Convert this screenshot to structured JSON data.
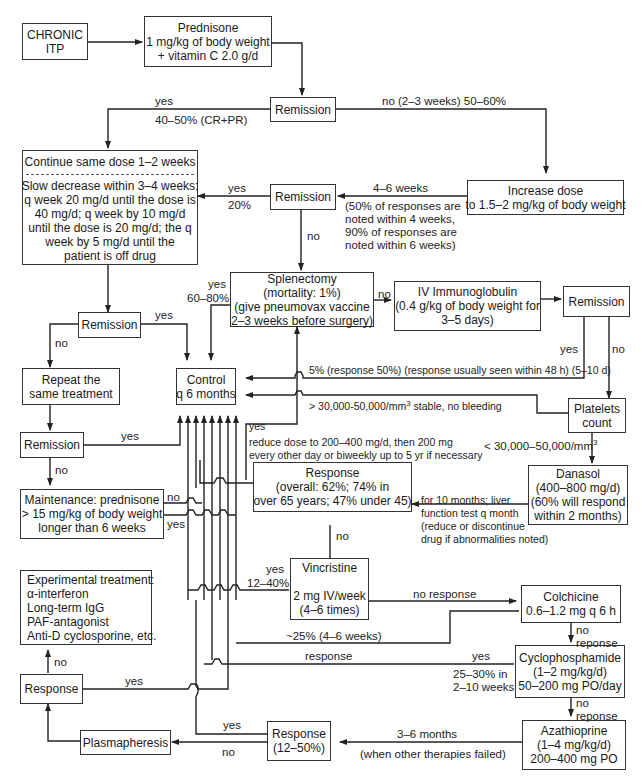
{
  "nodes": {
    "chronic_itp": [
      "CHRONIC",
      "ITP"
    ],
    "prednisone": [
      "Prednisone",
      "1 mg/kg of body weight",
      "+ vitamin C 2.0 g/d"
    ],
    "remission1": [
      "Remission"
    ],
    "continue_dose": {
      "header": "Continue same dose 1–2 weeks",
      "lines": [
        "Slow decrease within 3–4 weeks:",
        "q week 20 mg/d until the dose is",
        "40 mg/d; q week by 10 mg/d",
        "until the dose is 20 mg/d; the q",
        "week by 5 mg/d until the",
        "patient is off drug"
      ]
    },
    "increase_dose": [
      "Increase dose",
      "to 1.5–2 mg/kg of body weight"
    ],
    "remission2": [
      "Remission"
    ],
    "splenectomy": [
      "Splenectomy",
      "(mortality: 1%)",
      "(give pneumovax vaccine",
      "2–3 weeks before surgery)"
    ],
    "ivig": [
      "IV Immunoglobulin",
      "(0.4 g/kg of body weight for",
      "3–5 days)"
    ],
    "remission_ivig": [
      "Remission"
    ],
    "remission3": [
      "Remission"
    ],
    "repeat_treatment": [
      "Repeat the",
      "same treatment"
    ],
    "control": [
      "Control",
      "q 6 months"
    ],
    "platelets": [
      "Platelets",
      "count"
    ],
    "remission4": [
      "Remission"
    ],
    "danasol": [
      "Danasol",
      "(400–800 mg/d)",
      "(60% will respond",
      "within 2 months)"
    ],
    "response_danasol": [
      "Response",
      "(overall: 62%; 74% in",
      "over 65 years; 47% under 45)"
    ],
    "maintenance": [
      "Maintenance: prednisone",
      "> 15 mg/kg of body weight",
      "longer than 6 weeks"
    ],
    "experimental": [
      "Experimental treatment:",
      "α-interferon",
      "Long-term IgG",
      "PAF-antagonist",
      "Anti-D cyclosporine, etc."
    ],
    "vincristine": [
      "Vincristine",
      "",
      "2 mg IV/week",
      "(4–6 times)"
    ],
    "colchicine": [
      "Colchicine",
      "0.6–1.2 mg q 6 h"
    ],
    "cyclophosphamide": [
      "Cyclophosphamide",
      "(1–2 mg/kg/d)",
      "50–200 mg PO/day"
    ],
    "response_left": [
      "Response"
    ],
    "plasmapheresis": [
      "Plasmapheresis"
    ],
    "response_aza": [
      "Response",
      "(12–50%)"
    ],
    "azathioprine": [
      "Azathioprine",
      "(1–4 mg/kg/d)",
      "200–400 mg PO"
    ]
  },
  "labels": {
    "r1_yes": "yes",
    "r1_yes_pct": "40–50% (CR+PR)",
    "r1_no": "no (2–3 weeks) 50–60%",
    "r2_yes": "yes",
    "r2_yes_pct": "20%",
    "inc_weeks": "4–6 weeks",
    "inc_note": [
      "(50% of responses are",
      "noted within 4 weeks,",
      "90% of responses are",
      "noted within 6 weeks)"
    ],
    "r2_no": "no",
    "splen_yes": "yes",
    "splen_yes_pct": "60–80%",
    "splen_no": "no",
    "r3_yes": "yes",
    "r3_no": "no",
    "ivig_yes": "yes",
    "ivig_no": "no",
    "ivig_resp": "5% (response 50%) (response usually seen within 48 h) (5–10 d)",
    "platelets_high": "> 30,000-50,000/mm",
    "platelets_high_tail": " stable, no bleeding",
    "platelets_low": "< 30,000–50,000/mm",
    "sup3": "3",
    "r4_yes": "yes",
    "r4_no": "no",
    "danasol_yes": "yes",
    "danasol_reduce": [
      "reduce dose to 200–400 mg/d, then 200 mg",
      "every other day or biweekly up to 5 yr if necessary"
    ],
    "danasol_note": [
      "for 10 months; liver",
      "function test q month",
      "(reduce or discontinue",
      "drug if abnormalities noted)"
    ],
    "maint_no": "no",
    "maint_yes": "yes",
    "resp_no": "no",
    "vinc_yes": "yes",
    "vinc_yes_pct": "12–40%",
    "vinc_no_response": "no response",
    "colch_25": "~25% (4–6 weeks)",
    "colch_no": [
      "no",
      "reponse"
    ],
    "cyclo_response": "response",
    "cyclo_yes": "yes",
    "cyclo_pct": [
      "25–30% in",
      "2–10 weeks"
    ],
    "cyclo_no": [
      "no",
      "reponse"
    ],
    "exp_no": "no",
    "resp_left_yes": "yes",
    "aza_yes": "yes",
    "aza_no": "no",
    "aza_months": "3–6 months",
    "aza_note": "(when other therapies failed)"
  },
  "colors": {
    "line": "#222222",
    "box_border": "#333333",
    "background": "#ffffff"
  }
}
